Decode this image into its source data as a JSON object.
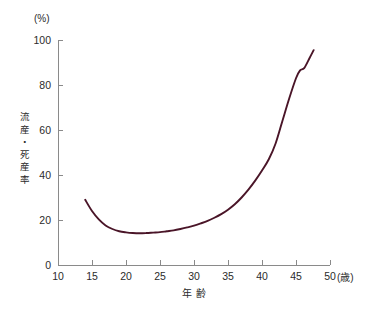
{
  "chart_data": {
    "type": "line",
    "title": "",
    "subtitle": "",
    "xlabel": "年 齢",
    "xunit": "(歳)",
    "ylabel": "流産・死産率",
    "yunit": "(%)",
    "xlim": [
      10,
      50
    ],
    "ylim": [
      0,
      100
    ],
    "xticks": [
      10,
      15,
      20,
      25,
      30,
      35,
      40,
      45,
      50
    ],
    "yticks": [
      0,
      20,
      40,
      60,
      80,
      100
    ],
    "xtick_labels": [
      "10",
      "15",
      "20",
      "25",
      "30",
      "35",
      "40",
      "45",
      "50"
    ],
    "ytick_labels": [
      "0",
      "20",
      "40",
      "60",
      "80",
      "100"
    ],
    "grid": false,
    "legend": false,
    "legend_position": "none",
    "line_color": "#4a1528",
    "axis_color": "#8a8a8a",
    "series": [
      {
        "name": "流産・死産率",
        "x": [
          14.0,
          15.0,
          16.0,
          17.0,
          18.0,
          19.0,
          20.0,
          21.0,
          22.0,
          23.0,
          24.0,
          25.0,
          26.0,
          27.0,
          28.0,
          29.0,
          30.0,
          31.0,
          32.0,
          33.0,
          34.0,
          35.0,
          36.0,
          37.0,
          38.0,
          39.0,
          40.0,
          41.0,
          42.0,
          43.0,
          44.0,
          45.0,
          45.6,
          46.2,
          47.0,
          47.6
        ],
        "y": [
          29.0,
          24.0,
          20.3,
          17.6,
          16.0,
          15.0,
          14.5,
          14.2,
          14.1,
          14.2,
          14.4,
          14.6,
          15.0,
          15.4,
          16.0,
          16.7,
          17.5,
          18.5,
          19.6,
          21.0,
          22.6,
          24.6,
          27.0,
          30.0,
          33.5,
          37.5,
          42.0,
          47.0,
          54.0,
          64.0,
          74.0,
          83.0,
          86.5,
          87.5,
          92.0,
          95.5
        ]
      }
    ]
  },
  "figure": {
    "name": "miscarriage-stillbirth-rate-by-maternal-age"
  }
}
